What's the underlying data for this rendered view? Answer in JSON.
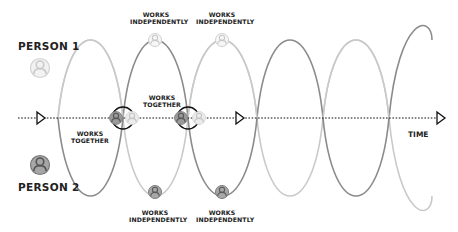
{
  "persons": {
    "person1": {
      "label": "PERSON 1",
      "color": "#c8c8c8"
    },
    "person2": {
      "label": "PERSON 2",
      "color": "#8e8e8e"
    }
  },
  "axis": {
    "label": "TIME"
  },
  "annotations": {
    "top_left": {
      "line1": "WORKS",
      "line2": "INDEPENDENTLY"
    },
    "top_right": {
      "line1": "WORKS",
      "line2": "INDEPENDENTLY"
    },
    "mid_upper": {
      "line1": "WORKS",
      "line2": "TOGETHER"
    },
    "mid_lower": {
      "line1": "WORKS",
      "line2": "TOGETHER"
    },
    "bottom_left": {
      "line1": "WORKS",
      "line2": "INDEPENDENTLY"
    },
    "bottom_right": {
      "line1": "WORKS",
      "line2": "INDEPENDENTLY"
    }
  },
  "colors": {
    "person1_wave": "#c9c9c9",
    "person2_wave": "#8a8a8a",
    "axis": "#111111",
    "highlight_ring": "#111111"
  }
}
